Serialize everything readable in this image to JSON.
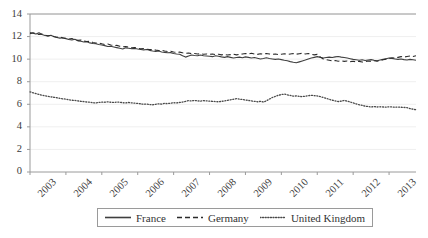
{
  "chart_data": {
    "type": "line",
    "title": "",
    "xlabel": "",
    "ylabel": "",
    "xlim": [
      2003,
      2013.75
    ],
    "ylim": [
      0,
      14
    ],
    "grid": true,
    "legend_position": "bottom",
    "y_ticks": [
      0,
      2,
      4,
      6,
      8,
      10,
      12,
      14
    ],
    "y_tick_labels": [
      "0",
      "2",
      "4",
      "6",
      "8",
      "10",
      "12",
      "14"
    ],
    "x_ticks": [
      2003,
      2004,
      2005,
      2006,
      2007,
      2008,
      2009,
      2010,
      2011,
      2012,
      2013
    ],
    "x_tick_labels": [
      "2003",
      "2004",
      "2005",
      "2006",
      "2007",
      "2008",
      "2009",
      "2010",
      "2011",
      "2012",
      "2013"
    ],
    "series": [
      {
        "name": "France",
        "style": "solid",
        "color": "#3f3f3f",
        "x": [
          2003.0,
          2003.083,
          2003.167,
          2003.25,
          2003.333,
          2003.417,
          2003.5,
          2003.583,
          2003.667,
          2003.75,
          2003.833,
          2003.917,
          2004.0,
          2004.083,
          2004.167,
          2004.25,
          2004.333,
          2004.417,
          2004.5,
          2004.583,
          2004.667,
          2004.75,
          2004.833,
          2004.917,
          2005.0,
          2005.083,
          2005.167,
          2005.25,
          2005.333,
          2005.417,
          2005.5,
          2005.583,
          2005.667,
          2005.75,
          2005.833,
          2005.917,
          2006.0,
          2006.083,
          2006.167,
          2006.25,
          2006.333,
          2006.417,
          2006.5,
          2006.583,
          2006.667,
          2006.75,
          2006.833,
          2006.917,
          2007.0,
          2007.083,
          2007.167,
          2007.25,
          2007.333,
          2007.417,
          2007.5,
          2007.583,
          2007.667,
          2007.75,
          2007.833,
          2007.917,
          2008.0,
          2008.083,
          2008.167,
          2008.25,
          2008.333,
          2008.417,
          2008.5,
          2008.583,
          2008.667,
          2008.75,
          2008.833,
          2008.917,
          2009.0,
          2009.083,
          2009.167,
          2009.25,
          2009.333,
          2009.417,
          2009.5,
          2009.583,
          2009.667,
          2009.75,
          2009.833,
          2009.917,
          2010.0,
          2010.083,
          2010.167,
          2010.25,
          2010.333,
          2010.417,
          2010.5,
          2010.583,
          2010.667,
          2010.75,
          2010.833,
          2010.917,
          2011.0,
          2011.083,
          2011.167,
          2011.25,
          2011.333,
          2011.417,
          2011.5,
          2011.583,
          2011.667,
          2011.75,
          2011.833,
          2011.917,
          2012.0,
          2012.083,
          2012.167,
          2012.25,
          2012.333,
          2012.417,
          2012.5,
          2012.583,
          2012.667,
          2012.75,
          2012.833,
          2012.917,
          2013.0,
          2013.083,
          2013.167,
          2013.25,
          2013.333,
          2013.417,
          2013.5,
          2013.583,
          2013.667,
          2013.75
        ],
        "values": [
          12.35,
          12.3,
          12.22,
          12.34,
          12.18,
          12.1,
          12.05,
          12.12,
          11.98,
          11.92,
          11.86,
          11.9,
          11.82,
          11.74,
          11.7,
          11.76,
          11.62,
          11.58,
          11.52,
          11.55,
          11.44,
          11.38,
          11.36,
          11.3,
          11.26,
          11.2,
          11.12,
          11.14,
          11.08,
          11.02,
          10.96,
          10.9,
          11.0,
          10.96,
          10.92,
          10.95,
          10.9,
          10.86,
          10.82,
          10.86,
          10.78,
          10.72,
          10.68,
          10.72,
          10.64,
          10.6,
          10.56,
          10.58,
          10.5,
          10.46,
          10.44,
          10.3,
          10.18,
          10.28,
          10.36,
          10.32,
          10.3,
          10.36,
          10.3,
          10.28,
          10.26,
          10.22,
          10.3,
          10.26,
          10.2,
          10.16,
          10.22,
          10.16,
          10.1,
          10.14,
          10.18,
          10.12,
          10.2,
          10.16,
          10.1,
          10.14,
          10.08,
          10.02,
          10.06,
          10.12,
          10.06,
          10.02,
          9.98,
          10.02,
          9.96,
          9.9,
          9.86,
          9.78,
          9.72,
          9.68,
          9.76,
          9.84,
          9.92,
          10.02,
          10.1,
          10.16,
          10.22,
          10.16,
          10.1,
          10.14,
          10.18,
          10.14,
          10.2,
          10.24,
          10.18,
          10.14,
          10.1,
          10.04,
          9.98,
          9.94,
          9.9,
          9.94,
          9.88,
          9.92,
          9.96,
          9.9,
          9.86,
          9.92,
          9.98,
          10.04,
          10.1,
          10.06,
          10.02,
          9.98,
          10.02,
          9.96,
          9.92,
          9.98,
          9.94,
          9.9
        ]
      },
      {
        "name": "Germany",
        "style": "dashed",
        "color": "#2b2b2b",
        "x": [
          2003.0,
          2003.083,
          2003.167,
          2003.25,
          2003.333,
          2003.417,
          2003.5,
          2003.583,
          2003.667,
          2003.75,
          2003.833,
          2003.917,
          2004.0,
          2004.083,
          2004.167,
          2004.25,
          2004.333,
          2004.417,
          2004.5,
          2004.583,
          2004.667,
          2004.75,
          2004.833,
          2004.917,
          2005.0,
          2005.083,
          2005.167,
          2005.25,
          2005.333,
          2005.417,
          2005.5,
          2005.583,
          2005.667,
          2005.75,
          2005.833,
          2005.917,
          2006.0,
          2006.083,
          2006.167,
          2006.25,
          2006.333,
          2006.417,
          2006.5,
          2006.583,
          2006.667,
          2006.75,
          2006.833,
          2006.917,
          2007.0,
          2007.083,
          2007.167,
          2007.25,
          2007.333,
          2007.417,
          2007.5,
          2007.583,
          2007.667,
          2007.75,
          2007.833,
          2007.917,
          2008.0,
          2008.083,
          2008.167,
          2008.25,
          2008.333,
          2008.417,
          2008.5,
          2008.583,
          2008.667,
          2008.75,
          2008.833,
          2008.917,
          2009.0,
          2009.083,
          2009.167,
          2009.25,
          2009.333,
          2009.417,
          2009.5,
          2009.583,
          2009.667,
          2009.75,
          2009.833,
          2009.917,
          2010.0,
          2010.083,
          2010.167,
          2010.25,
          2010.333,
          2010.417,
          2010.5,
          2010.583,
          2010.667,
          2010.75,
          2010.833,
          2010.917,
          2011.0,
          2011.083,
          2011.167,
          2011.25,
          2011.333,
          2011.417,
          2011.5,
          2011.583,
          2011.667,
          2011.75,
          2011.833,
          2011.917,
          2012.0,
          2012.083,
          2012.167,
          2012.25,
          2012.333,
          2012.417,
          2012.5,
          2012.583,
          2012.667,
          2012.75,
          2012.833,
          2012.917,
          2013.0,
          2013.083,
          2013.167,
          2013.25,
          2013.333,
          2013.417,
          2013.5,
          2013.583,
          2013.667,
          2013.75
        ],
        "values": [
          12.25,
          12.34,
          12.26,
          12.18,
          12.22,
          12.12,
          12.06,
          12.1,
          12.0,
          11.94,
          11.96,
          11.88,
          11.84,
          11.78,
          11.82,
          11.72,
          11.66,
          11.7,
          11.6,
          11.56,
          11.58,
          11.48,
          11.42,
          11.44,
          11.36,
          11.3,
          11.34,
          11.26,
          11.2,
          11.22,
          11.14,
          11.1,
          11.12,
          11.06,
          11.0,
          11.02,
          10.96,
          10.92,
          10.94,
          10.88,
          10.84,
          10.86,
          10.8,
          10.76,
          10.78,
          10.72,
          10.68,
          10.7,
          10.64,
          10.6,
          10.62,
          10.56,
          10.52,
          10.54,
          10.48,
          10.5,
          10.46,
          10.48,
          10.44,
          10.46,
          10.42,
          10.46,
          10.4,
          10.44,
          10.38,
          10.42,
          10.36,
          10.4,
          10.44,
          10.38,
          10.42,
          10.46,
          10.5,
          10.46,
          10.52,
          10.46,
          10.42,
          10.48,
          10.44,
          10.5,
          10.46,
          10.42,
          10.46,
          10.4,
          10.44,
          10.48,
          10.42,
          10.46,
          10.5,
          10.44,
          10.48,
          10.52,
          10.46,
          10.5,
          10.44,
          10.38,
          10.42,
          10.2,
          10.02,
          9.96,
          9.9,
          9.84,
          9.88,
          9.82,
          9.86,
          9.8,
          9.84,
          9.78,
          9.82,
          9.76,
          9.8,
          9.74,
          9.78,
          9.84,
          9.8,
          9.86,
          9.82,
          9.88,
          9.94,
          10.0,
          10.06,
          10.12,
          10.08,
          10.16,
          10.22,
          10.18,
          10.24,
          10.28,
          10.24,
          10.3
        ]
      },
      {
        "name": "United Kingdom",
        "style": "dotted",
        "color": "#4a4a4a",
        "x": [
          2003.0,
          2003.083,
          2003.167,
          2003.25,
          2003.333,
          2003.417,
          2003.5,
          2003.583,
          2003.667,
          2003.75,
          2003.833,
          2003.917,
          2004.0,
          2004.083,
          2004.167,
          2004.25,
          2004.333,
          2004.417,
          2004.5,
          2004.583,
          2004.667,
          2004.75,
          2004.833,
          2004.917,
          2005.0,
          2005.083,
          2005.167,
          2005.25,
          2005.333,
          2005.417,
          2005.5,
          2005.583,
          2005.667,
          2005.75,
          2005.833,
          2005.917,
          2006.0,
          2006.083,
          2006.167,
          2006.25,
          2006.333,
          2006.417,
          2006.5,
          2006.583,
          2006.667,
          2006.75,
          2006.833,
          2006.917,
          2007.0,
          2007.083,
          2007.167,
          2007.25,
          2007.333,
          2007.417,
          2007.5,
          2007.583,
          2007.667,
          2007.75,
          2007.833,
          2007.917,
          2008.0,
          2008.083,
          2008.167,
          2008.25,
          2008.333,
          2008.417,
          2008.5,
          2008.583,
          2008.667,
          2008.75,
          2008.833,
          2008.917,
          2009.0,
          2009.083,
          2009.167,
          2009.25,
          2009.333,
          2009.417,
          2009.5,
          2009.583,
          2009.667,
          2009.75,
          2009.833,
          2009.917,
          2010.0,
          2010.083,
          2010.167,
          2010.25,
          2010.333,
          2010.417,
          2010.5,
          2010.583,
          2010.667,
          2010.75,
          2010.833,
          2010.917,
          2011.0,
          2011.083,
          2011.167,
          2011.25,
          2011.333,
          2011.417,
          2011.5,
          2011.583,
          2011.667,
          2011.75,
          2011.833,
          2011.917,
          2012.0,
          2012.083,
          2012.167,
          2012.25,
          2012.333,
          2012.417,
          2012.5,
          2012.583,
          2012.667,
          2012.75,
          2012.833,
          2012.917,
          2013.0,
          2013.083,
          2013.167,
          2013.25,
          2013.333,
          2013.417,
          2013.5,
          2013.583,
          2013.667,
          2013.75
        ],
        "values": [
          7.1,
          7.02,
          6.94,
          6.88,
          6.8,
          6.76,
          6.7,
          6.66,
          6.62,
          6.58,
          6.52,
          6.48,
          6.46,
          6.4,
          6.36,
          6.34,
          6.3,
          6.26,
          6.24,
          6.2,
          6.18,
          6.14,
          6.12,
          6.16,
          6.2,
          6.18,
          6.22,
          6.18,
          6.16,
          6.2,
          6.18,
          6.14,
          6.12,
          6.16,
          6.12,
          6.1,
          6.08,
          6.04,
          6.0,
          6.02,
          5.98,
          5.96,
          6.0,
          6.04,
          6.02,
          6.08,
          6.06,
          6.1,
          6.14,
          6.12,
          6.16,
          6.2,
          6.26,
          6.32,
          6.3,
          6.34,
          6.3,
          6.28,
          6.32,
          6.3,
          6.28,
          6.26,
          6.24,
          6.22,
          6.26,
          6.3,
          6.34,
          6.4,
          6.44,
          6.5,
          6.46,
          6.42,
          6.38,
          6.34,
          6.3,
          6.26,
          6.22,
          6.26,
          6.2,
          6.3,
          6.46,
          6.6,
          6.7,
          6.8,
          6.86,
          6.9,
          6.84,
          6.78,
          6.72,
          6.74,
          6.7,
          6.68,
          6.72,
          6.76,
          6.8,
          6.76,
          6.74,
          6.68,
          6.6,
          6.52,
          6.44,
          6.36,
          6.3,
          6.24,
          6.28,
          6.34,
          6.28,
          6.2,
          6.12,
          6.04,
          5.96,
          5.9,
          5.84,
          5.8,
          5.76,
          5.8,
          5.76,
          5.78,
          5.76,
          5.74,
          5.78,
          5.76,
          5.74,
          5.76,
          5.74,
          5.72,
          5.7,
          5.62,
          5.56,
          5.52
        ]
      }
    ]
  },
  "legend": {
    "items": [
      {
        "label": "France",
        "style": "solid"
      },
      {
        "label": "Germany",
        "style": "dashed"
      },
      {
        "label": "United Kingdom",
        "style": "dotted"
      }
    ]
  },
  "axes": {
    "y_labels": [
      "14",
      "12",
      "10",
      "8",
      "6",
      "4",
      "2",
      "0"
    ],
    "x_labels": [
      "2003",
      "2004",
      "2005",
      "2006",
      "2007",
      "2008",
      "2009",
      "2010",
      "2011",
      "2012",
      "2013"
    ]
  },
  "colors": {
    "frame": "#9a9a9a",
    "grid": "#efefef",
    "series_france": "#3f3f3f",
    "series_germany": "#2b2b2b",
    "series_uk": "#4a4a4a",
    "text": "#3b3b3b"
  }
}
